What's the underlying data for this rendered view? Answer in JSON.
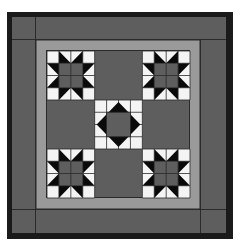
{
  "diagram": {
    "type": "quilt-pattern",
    "grid": {
      "rows": 3,
      "cols": 3
    },
    "blocks": [
      {
        "row": 0,
        "col": 0,
        "kind": "sawtooth-star"
      },
      {
        "row": 0,
        "col": 1,
        "kind": "plain"
      },
      {
        "row": 0,
        "col": 2,
        "kind": "sawtooth-star"
      },
      {
        "row": 1,
        "col": 0,
        "kind": "plain"
      },
      {
        "row": 1,
        "col": 1,
        "kind": "square-in-square"
      },
      {
        "row": 1,
        "col": 2,
        "kind": "plain"
      },
      {
        "row": 2,
        "col": 0,
        "kind": "sawtooth-star"
      },
      {
        "row": 2,
        "col": 1,
        "kind": "plain"
      },
      {
        "row": 2,
        "col": 2,
        "kind": "sawtooth-star"
      }
    ]
  },
  "colors": {
    "background": "#ffffff",
    "outer_border": "#1a1a1a",
    "wide_border": "#5e5e5e",
    "sashing": "#9a9a9a",
    "field": "#5e5e5e",
    "star_points": "#0a0a0a",
    "light": "#f4f4f4",
    "seam": "#2a2a2a"
  }
}
